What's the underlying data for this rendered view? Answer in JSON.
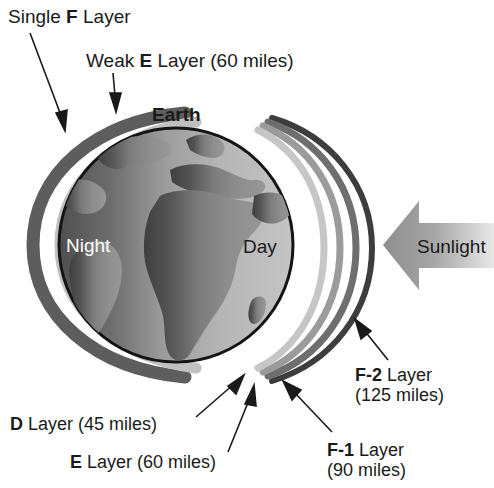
{
  "diagram": {
    "earth_label": "Earth",
    "night_label": "Night",
    "day_label": "Day",
    "sunlight_label": "Sunlight"
  },
  "labels": {
    "single_f": {
      "prefix": "Single ",
      "bold": "F",
      "suffix": " Layer"
    },
    "weak_e": {
      "prefix": "Weak ",
      "bold": "E",
      "suffix": " Layer (60 miles)"
    },
    "d_layer": {
      "bold": "D",
      "suffix": " Layer (45 miles)"
    },
    "e_layer": {
      "bold": "E",
      "suffix": " Layer (60 miles)"
    },
    "f1_layer": {
      "bold": "F-1",
      "suffix": " Layer",
      "line2": "(90 miles)"
    },
    "f2_layer": {
      "bold": "F-2",
      "suffix": " Layer",
      "line2": "(125 miles)"
    }
  },
  "colors": {
    "background": "#ffffff",
    "text": "#1a1a1a",
    "night_text": "#ffffff",
    "arc_f_night": "#585858",
    "arc_e_night": "#bdbdbd",
    "arc_d_day": "#c9c9c9",
    "arc_e_day": "#b0b0b0",
    "arc_f1_day": "#8a8a8a",
    "arc_f2_day": "#4a4a4a",
    "ocean_day": "#b8b8b8",
    "ocean_night": "#6a6a6a",
    "land": "#8f8f8f",
    "land_night": "#5a5a5a",
    "globe_outline": "#1a1a1a",
    "sunlight_arrow": "#9a9a9a"
  },
  "altitudes": {
    "d_miles": 45,
    "e_miles": 60,
    "f1_miles": 90,
    "f2_miles": 125,
    "weak_e_miles": 60
  }
}
